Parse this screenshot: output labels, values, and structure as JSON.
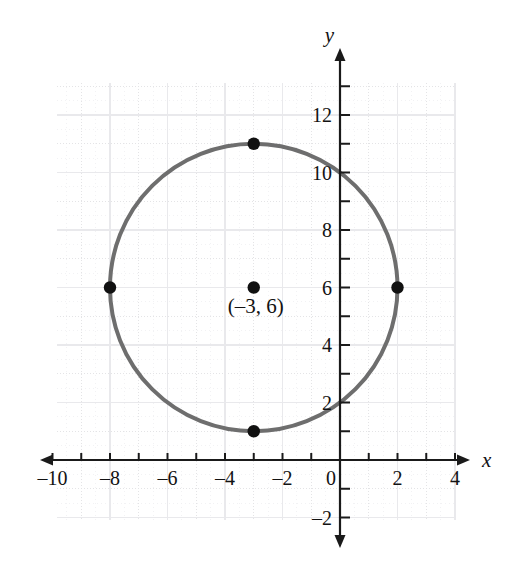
{
  "figure": {
    "title": "",
    "axis_labels": {
      "x": "x",
      "y": "y"
    },
    "center_point_label": "(–3, 6)"
  },
  "axes": {
    "x_tick_labels": [
      "–10",
      "–8",
      "–6",
      "–4",
      "–2",
      "0",
      "2",
      "4"
    ],
    "y_tick_labels": [
      "12",
      "10",
      "8",
      "6",
      "4",
      "2",
      "–2"
    ],
    "x_tick_values": [
      -10,
      -8,
      -6,
      -4,
      -2,
      0,
      2,
      4
    ],
    "y_tick_values": [
      12,
      10,
      8,
      6,
      4,
      2,
      -2
    ],
    "x_minor_ticks": [
      -10,
      -9,
      -8,
      -7,
      -6,
      -5,
      -4,
      -3,
      -2,
      -1,
      0,
      1,
      2,
      3,
      4
    ],
    "y_minor_ticks": [
      -2,
      -1,
      1,
      2,
      3,
      4,
      5,
      6,
      7,
      8,
      9,
      10,
      11,
      12,
      13
    ],
    "x_range": [
      -10.8,
      4.8
    ],
    "y_range": [
      -2.8,
      13.6
    ],
    "grid": true
  },
  "colors": {
    "curve": "#6e6e6e",
    "axis": "#1a1a1a",
    "point": "#111111",
    "grid_major": "#e4e4e6",
    "grid_minor": "#efeff1",
    "text": "#121212",
    "background": "#ffffff"
  },
  "chart_data": {
    "type": "scatter",
    "title": "",
    "xlabel": "x",
    "ylabel": "y",
    "xlim": [
      -10.8,
      4.8
    ],
    "ylim": [
      -2.8,
      13.6
    ],
    "grid": true,
    "legend": "none",
    "shapes": [
      {
        "kind": "circle",
        "center": [
          -3,
          6
        ],
        "radius": 5,
        "equation": "(x + 3)^2 + (y - 6)^2 = 25",
        "color": "#6e6e6e",
        "line_width": 4
      }
    ],
    "points": [
      {
        "name": "center",
        "x": -3,
        "y": 6,
        "label": "(–3, 6)"
      },
      {
        "name": "top",
        "x": -3,
        "y": 11,
        "label": ""
      },
      {
        "name": "bottom",
        "x": -3,
        "y": 1,
        "label": ""
      },
      {
        "name": "left",
        "x": -8,
        "y": 6,
        "label": ""
      },
      {
        "name": "right",
        "x": 2,
        "y": 6,
        "label": ""
      }
    ],
    "x": [
      -3,
      -3,
      -3,
      -8,
      2
    ],
    "y": [
      6,
      11,
      1,
      6,
      6
    ],
    "categories": [
      "center",
      "top",
      "bottom",
      "left",
      "right"
    ],
    "values": [
      6,
      11,
      1,
      6,
      6
    ]
  }
}
